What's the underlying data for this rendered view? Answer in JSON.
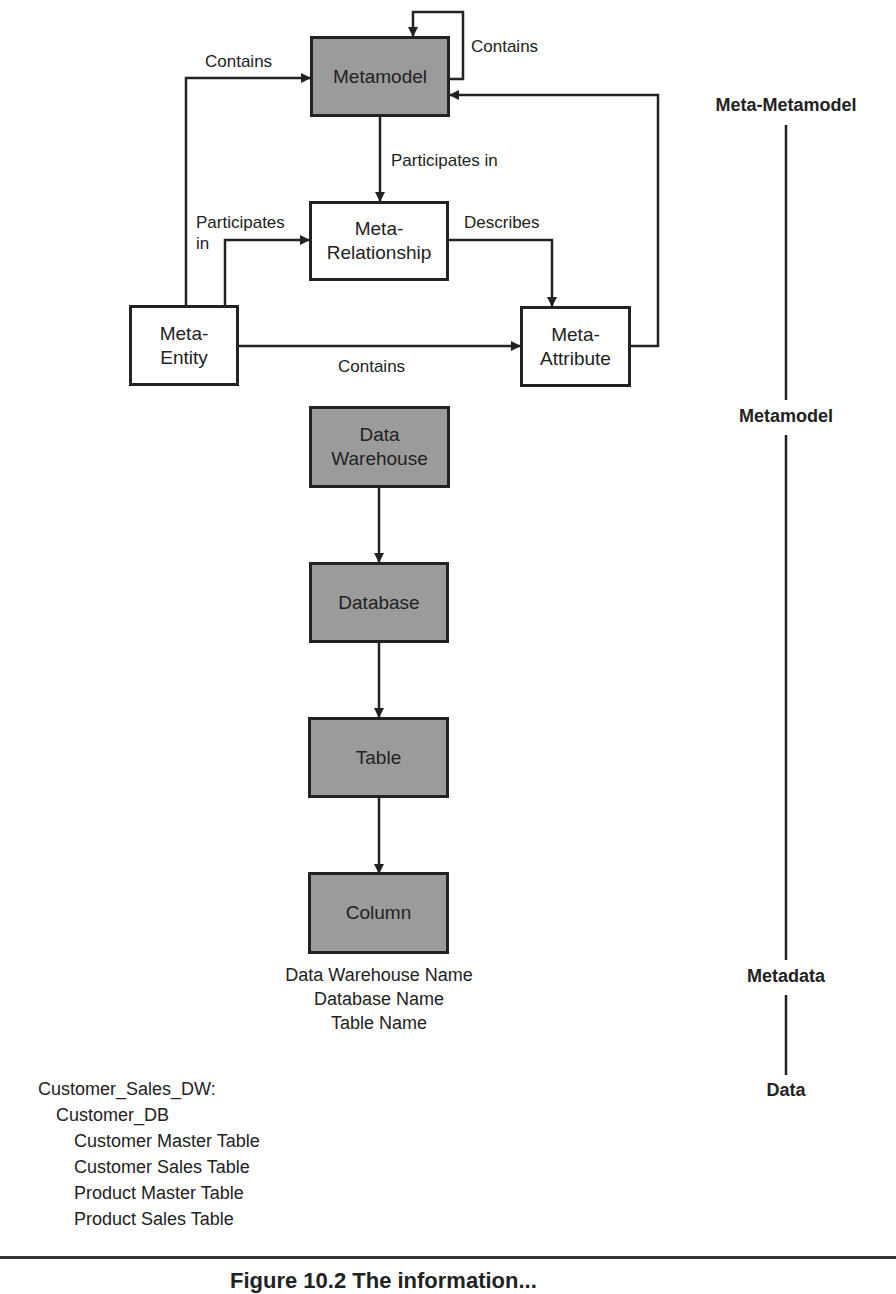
{
  "boxes": {
    "metamodel": "Metamodel",
    "meta_relationship": [
      "Meta-",
      "Relationship"
    ],
    "meta_entity": [
      "Meta-",
      "Entity"
    ],
    "meta_attribute": [
      "Meta-",
      "Attribute"
    ],
    "data_warehouse": [
      "Data",
      "Warehouse"
    ],
    "database": "Database",
    "table": "Table",
    "column": "Column"
  },
  "edge_labels": {
    "metamodel_self": "Contains",
    "entity_to_metamodel": "Contains",
    "metamodel_to_relationship": "Participates in",
    "entity_to_relationship": [
      "Participates",
      "in"
    ],
    "relationship_to_attribute": "Describes",
    "entity_to_attribute": "Contains"
  },
  "column_attributes": [
    "Data Warehouse Name",
    "Database Name",
    "Table Name"
  ],
  "levels": [
    "Meta-Metamodel",
    "Metamodel",
    "Metadata",
    "Data"
  ],
  "example": {
    "warehouse": "Customer_Sales_DW:",
    "database": "Customer_DB",
    "tables": [
      "Customer Master Table",
      "Customer Sales Table",
      "Product Master Table",
      "Product Sales Table"
    ]
  },
  "caption": "Figure 10.2  The information...",
  "colors": {
    "box_fill_gray": "#9b9b9b",
    "line": "#222222",
    "box_fill_white": "#ffffff"
  }
}
